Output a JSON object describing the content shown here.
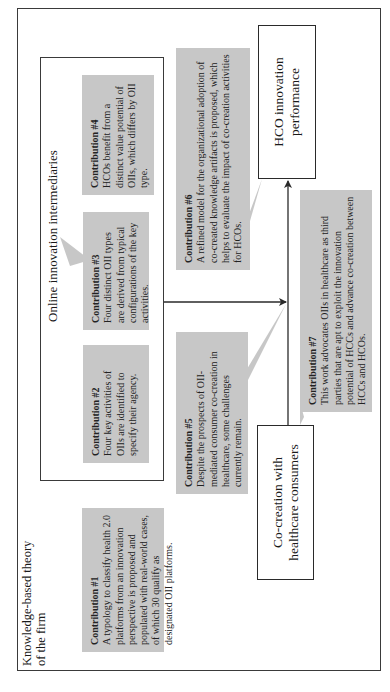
{
  "diagram": {
    "outer_frame": {
      "label_line1": "Knowledge-based theory",
      "label_line2": "of the firm"
    },
    "oii_frame": {
      "label": "Online innovation intermediaries"
    },
    "nodes": {
      "hco": {
        "line1": "HCO innovation",
        "line2": "performance"
      },
      "cocreation": {
        "line1": "Co-creation with",
        "line2": "healthcare consumers"
      }
    },
    "contributions": [
      {
        "title": "Contribution #1",
        "text": "A typology to classify health 2.0 platforms from an innovation perspective is proposed and populated with real-world cases, of which 30 qualify as designated OII platforms."
      },
      {
        "title": "Contribution #2",
        "text": "Four key activities of OIIs are identified to specify their agency."
      },
      {
        "title": "Contribution #3",
        "text": "Four distinct OII types are derived from typical configurations of the key activities."
      },
      {
        "title": "Contribution #4",
        "text": "HCOs benefit from a distinct value potential of OIIs, which differs by OII type."
      },
      {
        "title": "Contribution #5",
        "text": "Despite the prospects of OII-mediated consumer co-creation in healthcare, some challenges currently remain."
      },
      {
        "title": "Contribution #6",
        "text": "A refined model for the organizational adoption of co-created knowledge artifacts is proposed, which helps to evaluate the impact of co-creation activities for HCOs."
      },
      {
        "title": "Contribution #7",
        "text": "This work advocates OIIs in healthcare as third parties that are apt to exploit the innovation potential of HCCs and advance co-creation between HCCs and HCOs."
      }
    ],
    "colors": {
      "callout_fill": "#c7c7c7",
      "line": "#2a2a2a",
      "background": "#ffffff"
    },
    "orientation": "rotated-90-ccw"
  }
}
